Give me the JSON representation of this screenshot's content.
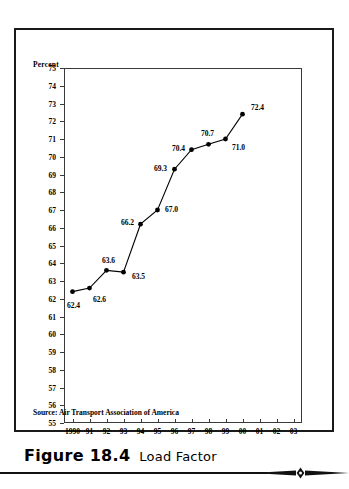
{
  "figure": {
    "number_label": "Figure 18.4",
    "title": "Load Factor",
    "source_note": "Source: Air Transport Association of America",
    "ornament_icon": "diamond-ornament-icon"
  },
  "chart_data": {
    "type": "line",
    "title": "",
    "xlabel": "",
    "ylabel": "Percent",
    "ylim": [
      55,
      75
    ],
    "ytick_step": 1,
    "yticks": [
      75,
      74,
      73,
      72,
      71,
      70,
      69,
      68,
      67,
      66,
      65,
      64,
      63,
      62,
      61,
      60,
      59,
      58,
      57,
      56,
      55
    ],
    "categories": [
      "1990",
      "91",
      "92",
      "93",
      "94",
      "95",
      "96",
      "97",
      "98",
      "99",
      "00",
      "01",
      "02",
      "03"
    ],
    "values": [
      62.4,
      62.6,
      63.6,
      63.5,
      66.2,
      67.0,
      69.3,
      70.4,
      70.7,
      71.0,
      72.4,
      null,
      null,
      null
    ],
    "point_labels": [
      "62.4",
      "62.6",
      "63.6",
      "63.5",
      "66.2",
      "67.0",
      "69.3",
      "70.4",
      "70.7",
      "71.0",
      "72.4"
    ],
    "grid": false,
    "legend": false,
    "marker": "filled-circle",
    "line_color": "#000000",
    "marker_color": "#000000",
    "axis_color": "#3a3a3a"
  }
}
